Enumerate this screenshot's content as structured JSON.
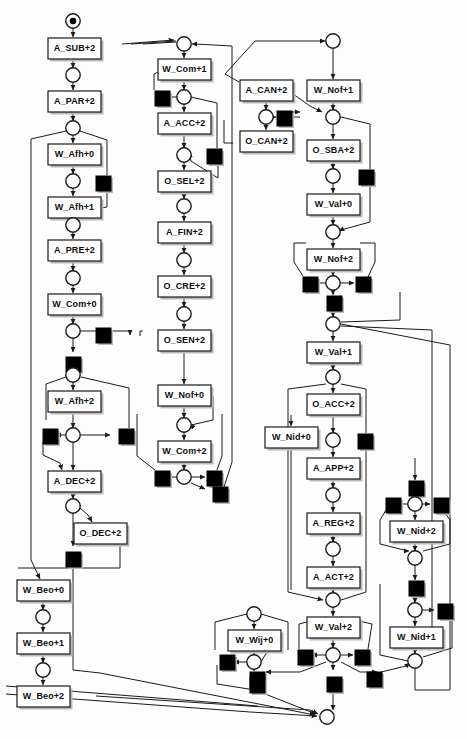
{
  "diagram": {
    "type": "petri-net",
    "width": 467,
    "height": 739,
    "colors": {
      "background": "#fdfdfd",
      "stroke": "#1a1a1a",
      "transition_fill": "#ffffff",
      "silent_transition_fill": "#000000",
      "shadow": "#b9b9b9",
      "label": "#0d0d0d"
    },
    "legend": {
      "place": "circle",
      "token": "filled dot inside place",
      "transition": "labelled rectangle",
      "silent_transition": "filled black square"
    }
  },
  "transitions": [
    {
      "id": "t_ASUB",
      "label": "A_SUB+2",
      "x": 48,
      "y": 38
    },
    {
      "id": "t_APAR",
      "label": "A_PAR+2",
      "x": 48,
      "y": 91
    },
    {
      "id": "t_WAFH0",
      "label": "W_Afh+0",
      "x": 48,
      "y": 144
    },
    {
      "id": "t_WAFH1",
      "label": "W_Afh+1",
      "x": 48,
      "y": 197
    },
    {
      "id": "t_APRE",
      "label": "A_PRE+2",
      "x": 48,
      "y": 240
    },
    {
      "id": "t_WCOM0",
      "label": "W_Com+0",
      "x": 48,
      "y": 294
    },
    {
      "id": "t_WAFH2",
      "label": "W_Afh+2",
      "x": 48,
      "y": 391
    },
    {
      "id": "t_ADEC",
      "label": "A_DEC+2",
      "x": 48,
      "y": 471
    },
    {
      "id": "t_ODEC",
      "label": "O_DEC+2",
      "x": 74,
      "y": 523
    },
    {
      "id": "t_WBEO0",
      "label": "W_Beo+0",
      "x": 17,
      "y": 580
    },
    {
      "id": "t_WBEO1",
      "label": "W_Beo+1",
      "x": 17,
      "y": 633
    },
    {
      "id": "t_WBEO2",
      "label": "W_Beo+2",
      "x": 17,
      "y": 686
    },
    {
      "id": "t_WCOM1",
      "label": "W_Com+1",
      "x": 158,
      "y": 59
    },
    {
      "id": "t_AACC",
      "label": "A_ACC+2",
      "x": 158,
      "y": 113
    },
    {
      "id": "t_OSEL",
      "label": "O_SEL+2",
      "x": 158,
      "y": 171
    },
    {
      "id": "t_AFIN",
      "label": "A_FIN+2",
      "x": 158,
      "y": 222
    },
    {
      "id": "t_OCRE",
      "label": "O_CRE+2",
      "x": 158,
      "y": 276
    },
    {
      "id": "t_OSEN",
      "label": "O_SEN+2",
      "x": 158,
      "y": 330
    },
    {
      "id": "t_WNOF0",
      "label": "W_Nof+0",
      "x": 158,
      "y": 385
    },
    {
      "id": "t_WCOM2",
      "label": "W_Com+2",
      "x": 158,
      "y": 441
    },
    {
      "id": "t_ACAN",
      "label": "A_CAN+2",
      "x": 240,
      "y": 80
    },
    {
      "id": "t_OCAN",
      "label": "O_CAN+2",
      "x": 240,
      "y": 131
    },
    {
      "id": "t_WNOF1",
      "label": "W_Nof+1",
      "x": 307,
      "y": 80
    },
    {
      "id": "t_OSBA",
      "label": "O_SBA+2",
      "x": 307,
      "y": 140
    },
    {
      "id": "t_WVAL0",
      "label": "W_Val+0",
      "x": 307,
      "y": 194
    },
    {
      "id": "t_WNOF2",
      "label": "W_Nof+2",
      "x": 307,
      "y": 249
    },
    {
      "id": "t_WVAL1",
      "label": "W_Val+1",
      "x": 307,
      "y": 342
    },
    {
      "id": "t_OACC",
      "label": "O_ACC+2",
      "x": 307,
      "y": 394
    },
    {
      "id": "t_WNID0",
      "label": "W_Nid+0",
      "x": 265,
      "y": 427
    },
    {
      "id": "t_AAPP",
      "label": "A_APP+2",
      "x": 307,
      "y": 458
    },
    {
      "id": "t_AREG",
      "label": "A_REG+2",
      "x": 307,
      "y": 513
    },
    {
      "id": "t_AACT",
      "label": "A_ACT+2",
      "x": 307,
      "y": 567
    },
    {
      "id": "t_WVAL2",
      "label": "W_Val+2",
      "x": 307,
      "y": 617
    },
    {
      "id": "t_WWIJ0",
      "label": "W_Wij+0",
      "x": 228,
      "y": 630
    },
    {
      "id": "t_WNID2",
      "label": "W_Nid+2",
      "x": 390,
      "y": 521
    },
    {
      "id": "t_WNID1",
      "label": "W_Nid+1",
      "x": 390,
      "y": 627
    }
  ],
  "places": [
    {
      "id": "p_start",
      "cx": 73,
      "cy": 21,
      "token": true
    },
    {
      "id": "p_1",
      "cx": 73,
      "cy": 75,
      "token": false
    },
    {
      "id": "p_2",
      "cx": 73,
      "cy": 128,
      "token": false
    },
    {
      "id": "p_3",
      "cx": 73,
      "cy": 181,
      "token": false
    },
    {
      "id": "p_4",
      "cx": 73,
      "cy": 225,
      "token": false
    },
    {
      "id": "p_5",
      "cx": 73,
      "cy": 278,
      "token": false
    },
    {
      "id": "p_6",
      "cx": 73,
      "cy": 331,
      "token": false
    },
    {
      "id": "p_7",
      "cx": 73,
      "cy": 375,
      "token": false
    },
    {
      "id": "p_8",
      "cx": 73,
      "cy": 435,
      "token": false
    },
    {
      "id": "p_9",
      "cx": 73,
      "cy": 506,
      "token": false
    },
    {
      "id": "p_10",
      "cx": 43,
      "cy": 617,
      "token": false
    },
    {
      "id": "p_11",
      "cx": 43,
      "cy": 670,
      "token": false
    },
    {
      "id": "p_20",
      "cx": 184,
      "cy": 44,
      "token": false
    },
    {
      "id": "p_21",
      "cx": 184,
      "cy": 97,
      "token": false
    },
    {
      "id": "p_22",
      "cx": 184,
      "cy": 155,
      "token": false
    },
    {
      "id": "p_23",
      "cx": 184,
      "cy": 206,
      "token": false
    },
    {
      "id": "p_24",
      "cx": 184,
      "cy": 260,
      "token": false
    },
    {
      "id": "p_25",
      "cx": 184,
      "cy": 314,
      "token": false
    },
    {
      "id": "p_26",
      "cx": 184,
      "cy": 425,
      "token": false
    },
    {
      "id": "p_27",
      "cx": 184,
      "cy": 477,
      "token": false
    },
    {
      "id": "p_30",
      "cx": 266,
      "cy": 117,
      "token": false
    },
    {
      "id": "p_40",
      "cx": 333,
      "cy": 41,
      "token": false
    },
    {
      "id": "p_41",
      "cx": 333,
      "cy": 117,
      "token": false
    },
    {
      "id": "p_42",
      "cx": 333,
      "cy": 176,
      "token": false
    },
    {
      "id": "p_43",
      "cx": 333,
      "cy": 232,
      "token": false
    },
    {
      "id": "p_44",
      "cx": 333,
      "cy": 283,
      "token": false
    },
    {
      "id": "p_45",
      "cx": 333,
      "cy": 324,
      "token": false
    },
    {
      "id": "p_46",
      "cx": 333,
      "cy": 377,
      "token": false
    },
    {
      "id": "p_47",
      "cx": 333,
      "cy": 440,
      "token": false
    },
    {
      "id": "p_48",
      "cx": 333,
      "cy": 495,
      "token": false
    },
    {
      "id": "p_49",
      "cx": 333,
      "cy": 549,
      "token": false
    },
    {
      "id": "p_50",
      "cx": 333,
      "cy": 600,
      "token": false
    },
    {
      "id": "p_51",
      "cx": 333,
      "cy": 655,
      "token": false
    },
    {
      "id": "p_end",
      "cx": 327,
      "cy": 717,
      "token": false
    },
    {
      "id": "p_60",
      "cx": 254,
      "cy": 614,
      "token": false
    },
    {
      "id": "p_61",
      "cx": 254,
      "cy": 662,
      "token": false
    },
    {
      "id": "p_70",
      "cx": 415,
      "cy": 504,
      "token": false
    },
    {
      "id": "p_71",
      "cx": 415,
      "cy": 558,
      "token": false
    },
    {
      "id": "p_72",
      "cx": 415,
      "cy": 610,
      "token": false
    },
    {
      "id": "p_73",
      "cx": 415,
      "cy": 661,
      "token": false
    }
  ],
  "silent_transitions": [
    {
      "id": "s_1",
      "x": 96,
      "y": 176
    },
    {
      "id": "s_2",
      "x": 96,
      "y": 328
    },
    {
      "id": "s_3",
      "x": 66,
      "y": 357
    },
    {
      "id": "s_4",
      "x": 43,
      "y": 429
    },
    {
      "id": "s_5",
      "x": 119,
      "y": 429
    },
    {
      "id": "s_6",
      "x": 66,
      "y": 552
    },
    {
      "id": "s_10",
      "x": 155,
      "y": 91
    },
    {
      "id": "s_11",
      "x": 207,
      "y": 149
    },
    {
      "id": "s_12",
      "x": 155,
      "y": 471
    },
    {
      "id": "s_13",
      "x": 207,
      "y": 471
    },
    {
      "id": "s_14",
      "x": 213,
      "y": 487
    },
    {
      "id": "s_20",
      "x": 277,
      "y": 111
    },
    {
      "id": "s_21",
      "x": 359,
      "y": 170
    },
    {
      "id": "s_22",
      "x": 303,
      "y": 277
    },
    {
      "id": "s_23",
      "x": 356,
      "y": 277
    },
    {
      "id": "s_24",
      "x": 327,
      "y": 296
    },
    {
      "id": "s_25",
      "x": 358,
      "y": 434
    },
    {
      "id": "s_26",
      "x": 298,
      "y": 650
    },
    {
      "id": "s_27",
      "x": 355,
      "y": 650
    },
    {
      "id": "s_28",
      "x": 250,
      "y": 672
    },
    {
      "id": "s_29",
      "x": 327,
      "y": 677
    },
    {
      "id": "s_30",
      "x": 367,
      "y": 672
    },
    {
      "id": "s_40",
      "x": 220,
      "y": 655
    },
    {
      "id": "s_41",
      "x": 250,
      "y": 678
    },
    {
      "id": "s_50",
      "x": 409,
      "y": 481
    },
    {
      "id": "s_51",
      "x": 386,
      "y": 498
    },
    {
      "id": "s_52",
      "x": 434,
      "y": 498
    },
    {
      "id": "s_53",
      "x": 409,
      "y": 581
    },
    {
      "id": "s_54",
      "x": 438,
      "y": 604
    }
  ],
  "stats": {
    "transition_count": 37,
    "place_count": 39,
    "silent_transition_count": 30
  }
}
